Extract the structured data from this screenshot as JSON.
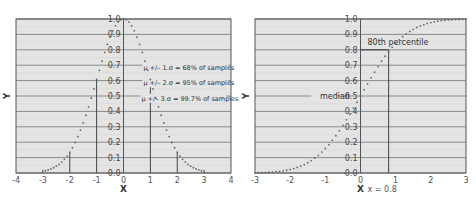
{
  "chart_data": [
    {
      "type": "scatter",
      "title": "",
      "subtitle": "Normal PDF (scaled to peak 1.0)",
      "xlabel": "X",
      "ylabel": "Y",
      "xlim": [
        -4,
        4
      ],
      "ylim": [
        0,
        1.0
      ],
      "xticks": [
        "-4",
        "-3",
        "-2",
        "-1",
        "0",
        "1",
        "2",
        "3",
        "4"
      ],
      "yticks": [
        "0.0",
        "0.1",
        "0.2",
        "0.3",
        "0.4",
        "0.5",
        "0.6",
        "0.7",
        "0.8",
        "0.9",
        "1.0"
      ],
      "grid": true,
      "series": [
        {
          "name": "normal density",
          "x": [
            -2.9,
            -2.8,
            -2.7,
            -2.6,
            -2.5,
            -2.4,
            -2.3,
            -2.2,
            -2.1,
            -2.0,
            -1.9,
            -1.8,
            -1.7,
            -1.6,
            -1.5,
            -1.4,
            -1.3,
            -1.2,
            -1.1,
            -1.0,
            -0.9,
            -0.8,
            -0.7,
            -0.6,
            -0.5,
            -0.4,
            -0.3,
            -0.2,
            -0.1,
            0.0,
            0.1,
            0.2,
            0.3,
            0.4,
            0.5,
            0.6,
            0.7,
            0.8,
            0.9,
            1.0,
            1.1,
            1.2,
            1.3,
            1.4,
            1.5,
            1.6,
            1.7,
            1.8,
            1.9,
            2.0,
            2.1,
            2.2,
            2.3,
            2.4,
            2.5,
            2.6,
            2.7,
            2.8,
            2.9
          ],
          "y": [
            0.015,
            0.02,
            0.026,
            0.034,
            0.044,
            0.056,
            0.071,
            0.089,
            0.11,
            0.135,
            0.164,
            0.198,
            0.236,
            0.278,
            0.325,
            0.375,
            0.43,
            0.487,
            0.546,
            0.607,
            0.667,
            0.726,
            0.783,
            0.835,
            0.882,
            0.923,
            0.956,
            0.98,
            0.995,
            1.0,
            0.995,
            0.98,
            0.956,
            0.923,
            0.882,
            0.835,
            0.783,
            0.726,
            0.667,
            0.607,
            0.546,
            0.487,
            0.43,
            0.375,
            0.325,
            0.278,
            0.236,
            0.198,
            0.164,
            0.135,
            0.11,
            0.089,
            0.071,
            0.056,
            0.044,
            0.034,
            0.026,
            0.02,
            0.015
          ]
        }
      ],
      "vlines": [
        {
          "x": -3,
          "ymax": 0.02
        },
        {
          "x": -2,
          "ymax": 0.135
        },
        {
          "x": -1,
          "ymax": 0.607
        },
        {
          "x": 0,
          "ymax": 1.0
        },
        {
          "x": 1,
          "ymax": 0.607
        },
        {
          "x": 2,
          "ymax": 0.135
        },
        {
          "x": 3,
          "ymax": 0.02
        }
      ],
      "annotations": [
        "μ +/– 1.σ = 68% of samples",
        "μ +/– 2.σ = 95% of samples",
        "μ +/– 3.σ = 99.7% of samples"
      ]
    },
    {
      "type": "scatter",
      "title": "",
      "subtitle": "Normal CDF",
      "xlabel": "X",
      "ylabel": "Y",
      "xlim": [
        -3,
        3
      ],
      "ylim": [
        0,
        1.0
      ],
      "xticks": [
        "-3",
        "-2",
        "-1",
        "0",
        "1",
        "2",
        "3"
      ],
      "yticks": [
        "0.0",
        "0.1",
        "0.2",
        "0.3",
        "0.4",
        "0.5",
        "0.6",
        "0.7",
        "0.8",
        "0.9",
        "1.0"
      ],
      "grid": true,
      "series": [
        {
          "name": "cumulative distribution",
          "x": [
            -3.0,
            -2.9,
            -2.8,
            -2.7,
            -2.6,
            -2.5,
            -2.4,
            -2.3,
            -2.2,
            -2.1,
            -2.0,
            -1.9,
            -1.8,
            -1.7,
            -1.6,
            -1.5,
            -1.4,
            -1.3,
            -1.2,
            -1.1,
            -1.0,
            -0.9,
            -0.8,
            -0.7,
            -0.6,
            -0.5,
            -0.4,
            -0.3,
            -0.2,
            -0.1,
            0.0,
            0.1,
            0.2,
            0.3,
            0.4,
            0.5,
            0.6,
            0.7,
            0.8,
            0.9,
            1.0,
            1.1,
            1.2,
            1.3,
            1.4,
            1.5,
            1.6,
            1.7,
            1.8,
            1.9,
            2.0,
            2.1,
            2.2,
            2.3,
            2.4,
            2.5,
            2.6,
            2.7,
            2.8,
            2.9,
            3.0
          ],
          "y": [
            0.001,
            0.002,
            0.003,
            0.003,
            0.005,
            0.006,
            0.008,
            0.011,
            0.014,
            0.018,
            0.023,
            0.029,
            0.036,
            0.045,
            0.055,
            0.067,
            0.081,
            0.097,
            0.115,
            0.136,
            0.159,
            0.184,
            0.212,
            0.242,
            0.274,
            0.309,
            0.345,
            0.382,
            0.421,
            0.46,
            0.5,
            0.54,
            0.579,
            0.618,
            0.655,
            0.691,
            0.726,
            0.758,
            0.788,
            0.816,
            0.841,
            0.864,
            0.885,
            0.903,
            0.919,
            0.933,
            0.945,
            0.955,
            0.964,
            0.971,
            0.977,
            0.982,
            0.986,
            0.989,
            0.992,
            0.994,
            0.995,
            0.997,
            0.997,
            0.998,
            0.999
          ]
        }
      ],
      "reference_lines": [
        {
          "type": "horizontal",
          "y": 0.5,
          "label": "median"
        },
        {
          "type": "horizontal",
          "y": 0.8,
          "xmin": 0,
          "xmax": 0.8,
          "label": "80th percentile"
        },
        {
          "type": "vertical",
          "x": 0.8,
          "label": "x = 0.8"
        }
      ],
      "annotations": [
        "median",
        "80th percentile",
        "x = 0.8"
      ]
    }
  ],
  "colors": {
    "plot_bg": "#e4e4e4",
    "grid": "#8a8a8a",
    "points": "#666666",
    "lines": "#444444"
  }
}
